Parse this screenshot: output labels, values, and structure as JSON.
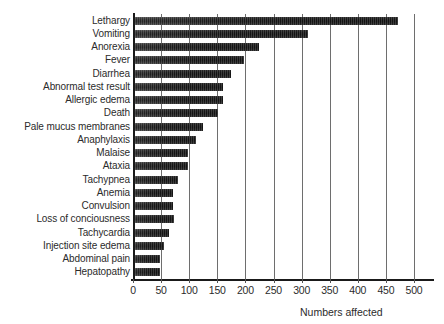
{
  "chart_data": {
    "type": "bar",
    "orientation": "horizontal",
    "title": "",
    "xlabel": "Numbers affected",
    "ylabel": "",
    "xlim": [
      0,
      500
    ],
    "xticks": [
      0,
      50,
      100,
      150,
      200,
      250,
      300,
      350,
      400,
      450,
      500
    ],
    "grid": true,
    "legend": false,
    "categories": [
      "Lethargy",
      "Vomiting",
      "Anorexia",
      "Fever",
      "Diarrhea",
      "Abnormal test result",
      "Allergic edema",
      "Death",
      "Pale  mucus membranes",
      "Anaphylaxis",
      "Malaise",
      "Ataxia",
      "Tachypnea",
      "Anemia",
      "Convulsion",
      "Loss of conciousness",
      "Tachycardia",
      "Injection site edema",
      "Abdominal pain",
      "Hepatopathy"
    ],
    "values": [
      472,
      311,
      224,
      198,
      174,
      160,
      160,
      151,
      125,
      112,
      98,
      98,
      80,
      72,
      72,
      73,
      64,
      55,
      48,
      48
    ],
    "bar_color": "#4a4a4a",
    "grid_color": "#6e6e6e",
    "axis_color": "#1a1a1a"
  }
}
